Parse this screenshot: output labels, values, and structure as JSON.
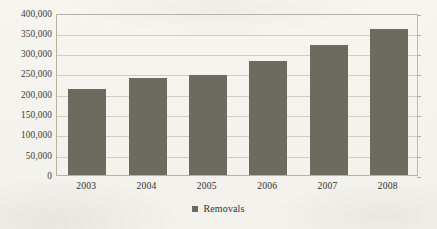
{
  "chart_data": {
    "type": "bar",
    "title": "",
    "xlabel": "",
    "ylabel": "",
    "categories": [
      "2003",
      "2004",
      "2005",
      "2006",
      "2007",
      "2008"
    ],
    "series": [
      {
        "name": "Removals",
        "values": [
          211000,
          240000,
          246000,
          280000,
          319000,
          359000
        ]
      }
    ],
    "ylim": [
      0,
      400000
    ],
    "ytick_values": [
      0,
      50000,
      100000,
      150000,
      200000,
      250000,
      300000,
      350000,
      400000
    ],
    "ytick_labels": [
      "0",
      "50,000",
      "100,000",
      "150,000",
      "200,000",
      "250,000",
      "300,000",
      "350,000",
      "400,000"
    ],
    "grid": true,
    "legend_position": "bottom",
    "bar_color": "#6c6b60",
    "gridline_color": "#cfccc3",
    "background_color": "#f6f4ef"
  },
  "legend": {
    "marker_name": "legend-color-swatch",
    "label": "Removals"
  }
}
